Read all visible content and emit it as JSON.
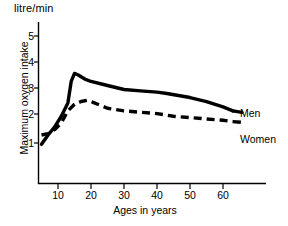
{
  "chart_data": {
    "type": "line",
    "title": "",
    "unit_label": "litre/min",
    "xlabel": "Ages in years",
    "ylabel": "Maximum oxygen intake",
    "xlim": [
      0,
      70
    ],
    "ylim": [
      0,
      5.6
    ],
    "xticks": [
      10,
      20,
      30,
      40,
      50,
      60
    ],
    "yticks": [
      1,
      2,
      3,
      4,
      5
    ],
    "grid": false,
    "legend_position": "right-inline",
    "series": [
      {
        "name": "Men",
        "style": "solid",
        "color": "#000000",
        "x": [
          5,
          7,
          9,
          11,
          13,
          14,
          15,
          16,
          18,
          20,
          25,
          30,
          35,
          40,
          43,
          50,
          55,
          60,
          63
        ],
        "values": [
          0.95,
          1.3,
          1.6,
          2.0,
          2.5,
          3.3,
          3.6,
          3.55,
          3.4,
          3.3,
          3.15,
          3.0,
          2.95,
          2.9,
          2.85,
          2.7,
          2.55,
          2.35,
          2.2
        ]
      },
      {
        "name": "Women",
        "style": "dashed",
        "color": "#000000",
        "x": [
          5,
          7,
          9,
          11,
          13,
          15,
          17,
          19,
          21,
          25,
          30,
          35,
          40,
          45,
          50,
          55,
          60,
          63
        ],
        "values": [
          1.3,
          1.35,
          1.5,
          1.75,
          2.2,
          2.45,
          2.55,
          2.6,
          2.5,
          2.3,
          2.2,
          2.15,
          2.1,
          2.0,
          1.95,
          1.9,
          1.85,
          1.8
        ]
      }
    ]
  },
  "axes": {
    "yticks": [
      {
        "label": "5"
      },
      {
        "label": "4"
      },
      {
        "label": "3"
      },
      {
        "label": "2"
      },
      {
        "label": "1"
      }
    ],
    "xticks": [
      {
        "label": "10"
      },
      {
        "label": "20"
      },
      {
        "label": "30"
      },
      {
        "label": "40"
      },
      {
        "label": "50"
      },
      {
        "label": "60"
      }
    ]
  },
  "labels": {
    "unit": "litre/min",
    "y_title": "Maximum oxygen intake",
    "x_title": "Ages in years",
    "men": "Men",
    "women": "Women"
  },
  "colors": {
    "axis": "#000000",
    "series": "#000000",
    "background": "#ffffff"
  }
}
